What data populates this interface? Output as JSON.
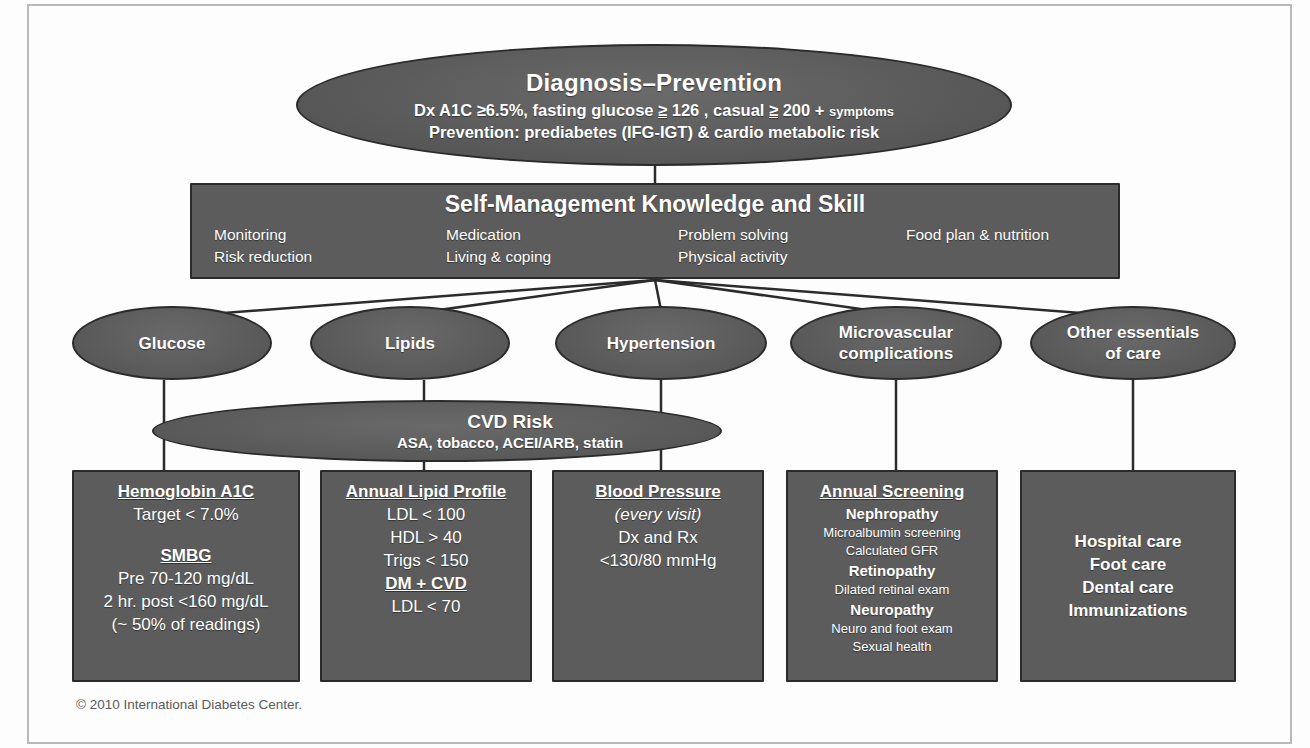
{
  "diagram": {
    "copyright": "© 2010 International Diabetes Center.",
    "colors": {
      "node_fill": "#5c5c5c",
      "node_border": "#2b2b2b",
      "text": "#ffffff",
      "background": "#fdfdfd",
      "connector": "#2b2b2b",
      "frame": "#b9b9b9"
    }
  },
  "top_node": {
    "title": "Diagnosis–Prevention",
    "line2_a": "Dx  A1C ≥6.5%, fasting glucose ",
    "line2_b": "≥",
    "line2_c": " 126 , casual ",
    "line2_d": "≥",
    "line2_e": " 200 + ",
    "line2_f": "symptoms",
    "line3_a": "Prevention:",
    "line3_b": "  prediabetes (IFG-IGT) & cardio metabolic risk"
  },
  "self_management": {
    "header": "Self-Management Knowledge and Skill",
    "columns": [
      {
        "items": [
          "Monitoring",
          "Risk reduction"
        ]
      },
      {
        "items": [
          "Medication",
          "Living & coping"
        ]
      },
      {
        "items": [
          "Problem solving",
          "Physical activity"
        ]
      },
      {
        "items": [
          "Food plan & nutrition"
        ]
      }
    ]
  },
  "domains": [
    {
      "label": "Glucose"
    },
    {
      "label": "Lipids"
    },
    {
      "label": "Hypertension"
    },
    {
      "label_line1": "Microvascular",
      "label_line2": "complications"
    },
    {
      "label_line1": "Other essentials",
      "label_line2": "of care"
    }
  ],
  "cvd_risk": {
    "title": "CVD Risk",
    "subtitle": "ASA, tobacco, ACEI/ARB, statin"
  },
  "detail_boxes": {
    "a1c": {
      "heading": "Hemoglobin A1C",
      "target": "Target < 7.0%",
      "subheading": "SMBG",
      "pre": "Pre    70-120 mg/dL",
      "post": "2 hr. post <160 mg/dL",
      "note": "(~ 50% of readings)"
    },
    "lipid": {
      "heading": "Annual Lipid Profile",
      "ldl": "LDL < 100",
      "hdl": "HDL > 40",
      "trigs": "Trigs < 150",
      "subheading": "DM + CVD",
      "ldl2": "LDL < 70"
    },
    "bp": {
      "heading": "Blood Pressure",
      "frequency": "(every visit)",
      "dxrx": "Dx and Rx",
      "target": "<130/80 mmHg"
    },
    "screening": {
      "heading": "Annual Screening",
      "nephropathy": "Nephropathy",
      "nephropathy_d1": "Microalbumin screening",
      "nephropathy_d2": "Calculated GFR",
      "retinopathy": "Retinopathy",
      "retinopathy_d1": "Dilated retinal exam",
      "neuropathy": "Neuropathy",
      "neuropathy_d1": "Neuro and foot exam",
      "neuropathy_d2": "Sexual health"
    },
    "other": {
      "item1": "Hospital care",
      "item2": "Foot care",
      "item3": "Dental care",
      "item4": "Immunizations"
    }
  }
}
